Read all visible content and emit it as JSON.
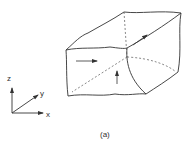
{
  "figure": {
    "caption": "(a)",
    "axes": {
      "z_label": "z",
      "y_label": "y",
      "x_label": "x"
    },
    "block": {
      "description": "rock element with stress arrows on faces",
      "arrows": [
        "front-face-horizontal",
        "front-face-vertical",
        "top-face-diagonal"
      ]
    },
    "colors": {
      "stroke": "#333333",
      "background": "#ffffff"
    }
  }
}
